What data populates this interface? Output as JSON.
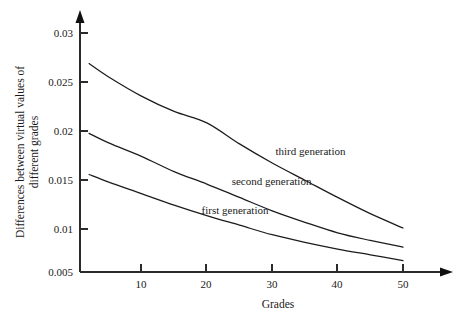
{
  "chart_data": {
    "type": "line",
    "title": "",
    "xlabel": "Grades",
    "ylabel_line1": "Differences between virtual values of",
    "ylabel_line2": "different grades",
    "xlim": [
      0,
      57.5
    ],
    "ylim": [
      0.005,
      0.0305
    ],
    "grid": false,
    "legend_position": "inline-curve-labels",
    "xticks": [
      10,
      20,
      30,
      40,
      50
    ],
    "xtick_labels": [
      "10",
      "20",
      "30",
      "40",
      "50"
    ],
    "yticks": [
      0.03,
      0.025,
      0.02,
      0.015,
      0.01,
      0.005
    ],
    "ytick_labels": [
      "0.03",
      "0.025",
      "0.02",
      "0.015",
      "0.01",
      "0.005"
    ],
    "x": [
      2,
      5,
      10,
      15,
      20,
      25,
      30,
      35,
      40,
      45,
      50
    ],
    "series": [
      {
        "name": "third generation",
        "label": "third generation",
        "label_x": 30.5,
        "label_y": 0.0172,
        "values": [
          0.0268,
          0.0254,
          0.0234,
          0.0218,
          0.0206,
          0.0184,
          0.0164,
          0.0146,
          0.0128,
          0.0111,
          0.0096
        ]
      },
      {
        "name": "second generation",
        "label": "second generation",
        "label_x": 23.8,
        "label_y": 0.0141,
        "values": [
          0.0195,
          0.0185,
          0.0171,
          0.0155,
          0.0142,
          0.0128,
          0.0114,
          0.0102,
          0.0091,
          0.0083,
          0.0076
        ]
      },
      {
        "name": "first generation",
        "label": "first generation",
        "label_x": 19.2,
        "label_y": 0.0111,
        "values": [
          0.0152,
          0.0144,
          0.0132,
          0.012,
          0.0109,
          0.0099,
          0.0089,
          0.0081,
          0.0074,
          0.0068,
          0.0062
        ]
      }
    ],
    "axis_color": "#2b2b2b",
    "curve_color": "#1c1c1c",
    "background_color": "#ffffff"
  }
}
